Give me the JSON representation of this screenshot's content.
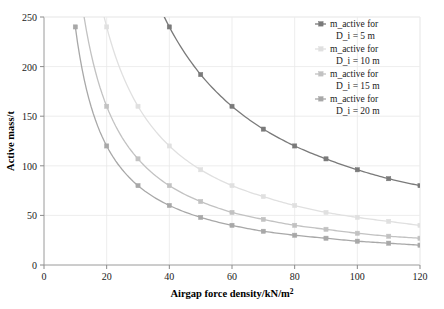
{
  "chart_data": {
    "type": "line",
    "title": "",
    "xlabel": "Airgap force density/kN/m²",
    "ylabel": "Active mass/t",
    "xlim": [
      0,
      120
    ],
    "ylim": [
      0,
      250
    ],
    "xticks": [
      0,
      20,
      40,
      60,
      80,
      100,
      120
    ],
    "yticks": [
      0,
      50,
      100,
      150,
      200,
      250
    ],
    "grid": true,
    "legend_position": "top-right",
    "x": [
      10,
      20,
      30,
      40,
      50,
      60,
      70,
      80,
      90,
      100,
      110,
      120
    ],
    "series": [
      {
        "name": "m_active for D_i = 5 m",
        "label_line1": "m_active for",
        "label_line2": "D_i = 5 m",
        "color": "#7a7a7a",
        "marker": "square",
        "values": [
          960,
          480,
          320,
          240,
          192,
          160,
          137,
          120,
          107,
          96,
          87,
          80
        ]
      },
      {
        "name": "m_active for D_i = 10 m",
        "label_line1": "m_active for",
        "label_line2": "D_i = 10 m",
        "color": "#e0e0e0",
        "marker": "square",
        "values": [
          480,
          240,
          160,
          120,
          96,
          80,
          69,
          60,
          53,
          48,
          44,
          40
        ]
      },
      {
        "name": "m_active for D_i = 15 m",
        "label_line1": "m_active for",
        "label_line2": "D_i = 15 m",
        "color": "#c2c2c2",
        "marker": "square",
        "values": [
          320,
          160,
          107,
          80,
          64,
          53,
          46,
          40,
          36,
          32,
          29,
          27
        ]
      },
      {
        "name": "m_active for D_i = 20 m",
        "label_line1": "m_active for",
        "label_line2": "D_i = 20 m",
        "color": "#a8a8a8",
        "marker": "square",
        "values": [
          240,
          120,
          80,
          60,
          48,
          40,
          34,
          30,
          27,
          24,
          22,
          20
        ]
      }
    ]
  },
  "legend": {
    "entries": [
      {
        "line1": "m_active for",
        "line2": "D_i = 5 m",
        "color": "#7a7a7a"
      },
      {
        "line1": "m_active for",
        "line2": "D_i = 10 m",
        "color": "#e0e0e0"
      },
      {
        "line1": "m_active for",
        "line2": "D_i = 15 m",
        "color": "#c2c2c2"
      },
      {
        "line1": "m_active for",
        "line2": "D_i = 20 m",
        "color": "#a8a8a8"
      }
    ]
  }
}
